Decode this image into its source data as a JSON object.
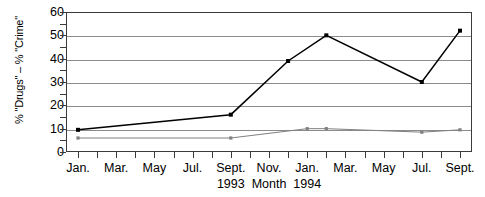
{
  "chart_data": {
    "type": "line",
    "title": "",
    "xlabel": "Month",
    "ylabel": "% \"Drugs\" – % \"Crime\"",
    "ylim": [
      0,
      60
    ],
    "ytick_step": 10,
    "yminor_step": 5,
    "grid": "horizontal",
    "legend": "none",
    "yticks": [
      "0",
      "10",
      "20",
      "30",
      "40",
      "50",
      "60"
    ],
    "x": [
      "Jan. 1993",
      "Feb. 1993",
      "Mar. 1993",
      "Apr. 1993",
      "May 1993",
      "Jun. 1993",
      "Jul. 1993",
      "Aug. 1993",
      "Sept. 1993",
      "Oct. 1993",
      "Nov. 1993",
      "Dec. 1993",
      "Jan. 1994",
      "Feb. 1994",
      "Mar. 1994",
      "Apr. 1994",
      "May 1994",
      "Jun. 1994",
      "Jul. 1994",
      "Aug. 1994",
      "Sept. 1994"
    ],
    "xtick_labels": [
      {
        "index": 0,
        "label": "Jan.",
        "sub": ""
      },
      {
        "index": 2,
        "label": "Mar.",
        "sub": ""
      },
      {
        "index": 4,
        "label": "May",
        "sub": ""
      },
      {
        "index": 6,
        "label": "Jul.",
        "sub": ""
      },
      {
        "index": 8,
        "label": "Sept.",
        "sub": "1993"
      },
      {
        "index": 10,
        "label": "Nov.",
        "sub": "Month"
      },
      {
        "index": 12,
        "label": "Jan.",
        "sub": "1994"
      },
      {
        "index": 14,
        "label": "Mar.",
        "sub": ""
      },
      {
        "index": 16,
        "label": "May",
        "sub": ""
      },
      {
        "index": 18,
        "label": "Jul.",
        "sub": ""
      },
      {
        "index": 20,
        "label": "Sept.",
        "sub": ""
      }
    ],
    "series": [
      {
        "name": "black-series",
        "color": "#000000",
        "marker": "square",
        "points": [
          {
            "index": 0,
            "value": 9.5
          },
          {
            "index": 8,
            "value": 16
          },
          {
            "index": 11,
            "value": 39
          },
          {
            "index": 13,
            "value": 50
          },
          {
            "index": 18,
            "value": 30
          },
          {
            "index": 20,
            "value": 52
          }
        ]
      },
      {
        "name": "gray-series",
        "color": "#808080",
        "marker": "square",
        "points": [
          {
            "index": 0,
            "value": 6
          },
          {
            "index": 8,
            "value": 6
          },
          {
            "index": 12,
            "value": 10
          },
          {
            "index": 13,
            "value": 10
          },
          {
            "index": 18,
            "value": 8.5
          },
          {
            "index": 20,
            "value": 9.5
          }
        ]
      }
    ]
  },
  "axis": {
    "ylabel_text": "% \"Drugs\" – % \"Crime\""
  }
}
